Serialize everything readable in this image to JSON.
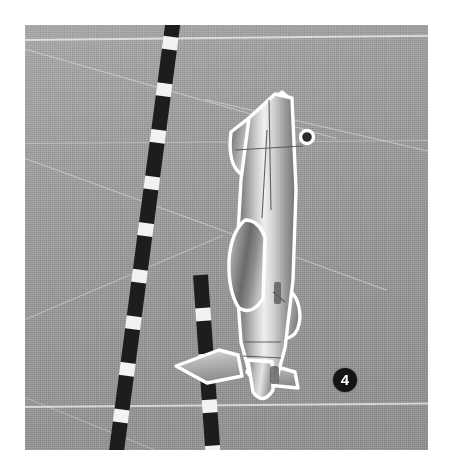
{
  "figure": {
    "number_label": "4",
    "orientation": "top-down",
    "border_color": "#ffffff",
    "background_color": "#9a9a9a",
    "badge_background": "#141414",
    "badge_text_color": "#ffffff",
    "marking_color": "#ffffff",
    "centerline_color": "#1d1d1d"
  },
  "scene": {
    "surface_name": "tarmac",
    "centerline_name": "dashed-taxiway-centerline",
    "markings": [
      {
        "name": "apron-edge-line-top"
      },
      {
        "name": "taxiway-guide-line-upper-left"
      },
      {
        "name": "taxiway-guide-line-upper-right"
      },
      {
        "name": "taxiway-guide-line-mid"
      },
      {
        "name": "apron-edge-line-bottom"
      },
      {
        "name": "taxiway-guide-line-lower-left"
      }
    ]
  },
  "aircraft": {
    "name": "jet-aircraft",
    "parts": [
      {
        "name": "vertical-stabilizer"
      },
      {
        "name": "fuselage"
      },
      {
        "name": "canopy"
      },
      {
        "name": "horizontal-stabilizer-right"
      },
      {
        "name": "wing-left"
      },
      {
        "name": "wing-right"
      },
      {
        "name": "nose"
      },
      {
        "name": "antenna-probe"
      }
    ]
  },
  "caption": {
    "text": ""
  }
}
